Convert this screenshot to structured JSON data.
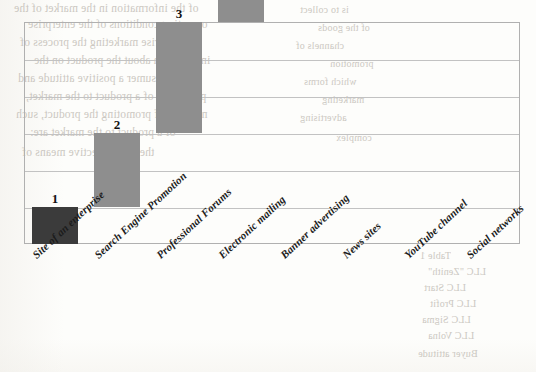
{
  "chart_data": {
    "type": "bar",
    "subtype": "waterfall-staircase",
    "title": "",
    "subtitle": "",
    "xlabel": "",
    "ylabel": "",
    "categories": [
      "Site of an enterprise",
      "Search Engine Promotion",
      "Professional Forums",
      "Electronic mailing",
      "Banner advertising",
      "News sites",
      "YouTube channel",
      "Social networks"
    ],
    "values": [
      1,
      2,
      3,
      3,
      4,
      5,
      5,
      5
    ],
    "data_labels": [
      "1",
      "2",
      "3",
      "3",
      "4",
      "5",
      "5",
      "5"
    ],
    "bar_shades": [
      "dark",
      "light",
      "light",
      "light",
      "dark",
      "dark",
      "dark",
      "dark"
    ],
    "ylim": [
      0,
      6
    ],
    "gridlines": [
      0,
      1,
      2,
      3,
      4,
      5,
      6
    ],
    "grid": true,
    "tick_labels_y": [],
    "legend": "none",
    "legend_position": "none",
    "colors": {
      "bar_dark": "#3b3b3b",
      "bar_light": "#8e8e8e",
      "gridline": "#c2c2c2",
      "frame": "#b0b0b0",
      "label_text": "#1c1c1c",
      "paper": "#fdfdfb",
      "bleed_text": "#b9b4ac"
    }
  },
  "bleed_through": {
    "note": "faint mirrored text showing through from the reverse side of the scanned page",
    "lines_left": [
      "of the information in the market of the",
      "operating conditions of the enterprise",
      "enterprise marketing the process of",
      "information about the product on the",
      "the consumer a positive attitude and",
      "promotion of a product to the market,",
      "methods of promoting the product, such",
      "of a product to the market are:",
      "the most effective means of"
    ],
    "lines_right": [
      "is to collect",
      "of the goods",
      "channels of",
      "promotion",
      "which forms",
      "marketing",
      "advertising",
      "complex"
    ],
    "lines_bottom": [
      "Table 1",
      "LLC \"Zenith\"",
      "LLC Start",
      "LLC Profit",
      "LLC Sigma",
      "LLC Volna",
      "Buyer attitude"
    ]
  }
}
